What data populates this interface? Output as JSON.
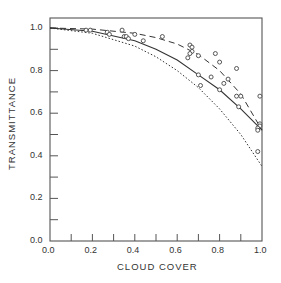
{
  "chart_data": {
    "type": "scatter",
    "title": "",
    "xlabel": "CLOUD COVER",
    "ylabel": "TRANSMITTANCE",
    "xlim": [
      0.0,
      1.0
    ],
    "ylim": [
      0.0,
      1.05
    ],
    "x_ticks": [
      "0.0",
      "0.2",
      "0.4",
      "0.6",
      "0.8",
      "1.0"
    ],
    "y_ticks": [
      "0.0",
      "0.2",
      "0.4",
      "0.6",
      "0.8",
      "1.0"
    ],
    "grid": false,
    "legend": null,
    "series": [
      {
        "name": "observations",
        "style": "open-circle",
        "points": [
          [
            0.17,
            0.99
          ],
          [
            0.19,
            0.99
          ],
          [
            0.27,
            0.98
          ],
          [
            0.28,
            0.97
          ],
          [
            0.34,
            0.99
          ],
          [
            0.35,
            0.96
          ],
          [
            0.36,
            0.96
          ],
          [
            0.37,
            0.95
          ],
          [
            0.4,
            0.97
          ],
          [
            0.44,
            0.94
          ],
          [
            0.53,
            0.96
          ],
          [
            0.66,
            0.92
          ],
          [
            0.67,
            0.91
          ],
          [
            0.67,
            0.89
          ],
          [
            0.66,
            0.88
          ],
          [
            0.65,
            0.86
          ],
          [
            0.7,
            0.87
          ],
          [
            0.78,
            0.88
          ],
          [
            0.8,
            0.84
          ],
          [
            0.88,
            0.81
          ],
          [
            0.7,
            0.78
          ],
          [
            0.76,
            0.77
          ],
          [
            0.71,
            0.73
          ],
          [
            0.82,
            0.74
          ],
          [
            0.84,
            0.76
          ],
          [
            0.8,
            0.71
          ],
          [
            0.88,
            0.68
          ],
          [
            0.9,
            0.68
          ],
          [
            0.89,
            0.63
          ],
          [
            0.99,
            0.68
          ],
          [
            0.99,
            0.55
          ],
          [
            0.99,
            0.54
          ],
          [
            0.98,
            0.53
          ],
          [
            0.98,
            0.52
          ],
          [
            0.98,
            0.42
          ]
        ]
      },
      {
        "name": "dashed-curve",
        "style": "dashed",
        "x": [
          0.0,
          0.2,
          0.4,
          0.5,
          0.6,
          0.7,
          0.8,
          0.9,
          1.0
        ],
        "y": [
          1.0,
          0.995,
          0.975,
          0.955,
          0.925,
          0.875,
          0.8,
          0.69,
          0.52
        ]
      },
      {
        "name": "solid-curve",
        "style": "solid",
        "x": [
          0.0,
          0.2,
          0.4,
          0.5,
          0.6,
          0.7,
          0.8,
          0.9,
          1.0
        ],
        "y": [
          1.0,
          0.985,
          0.94,
          0.9,
          0.85,
          0.78,
          0.71,
          0.62,
          0.52
        ]
      },
      {
        "name": "dotted-curve",
        "style": "dotted",
        "x": [
          0.0,
          0.2,
          0.4,
          0.5,
          0.6,
          0.7,
          0.8,
          0.9,
          1.0
        ],
        "y": [
          1.0,
          0.975,
          0.915,
          0.865,
          0.8,
          0.72,
          0.62,
          0.5,
          0.35
        ]
      }
    ]
  }
}
